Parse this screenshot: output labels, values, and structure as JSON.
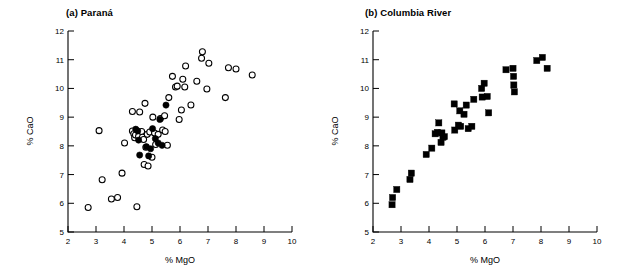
{
  "figure": {
    "background": "#ffffff",
    "ink": "#000000"
  },
  "panels": [
    {
      "id": "a",
      "title": "(a) Paraná",
      "xlabel": "% MgO",
      "ylabel": "% CaO"
    },
    {
      "id": "b",
      "title": "(b) Columbia River",
      "xlabel": "% MgO",
      "ylabel": "% CaO"
    }
  ],
  "axes": {
    "x_ticks": [
      "2",
      "3",
      "4",
      "5",
      "6",
      "7",
      "8",
      "9",
      "10"
    ],
    "y_ticks": [
      "5",
      "6",
      "7",
      "8",
      "9",
      "10",
      "11",
      "12"
    ],
    "xlim": [
      2,
      10
    ],
    "ylim": [
      5,
      12
    ]
  },
  "chart_data": [
    {
      "type": "scatter",
      "title": "(a) Paraná",
      "xlabel": "% MgO",
      "ylabel": "% CaO",
      "xlim": [
        2,
        10
      ],
      "ylim": [
        5,
        12
      ],
      "grid": false,
      "legend": "none",
      "series": [
        {
          "name": "open-circles",
          "marker": "open circle",
          "points": [
            [
              2.72,
              5.85
            ],
            [
              3.11,
              8.53
            ],
            [
              3.22,
              6.82
            ],
            [
              3.55,
              6.15
            ],
            [
              3.77,
              6.2
            ],
            [
              3.93,
              7.05
            ],
            [
              4.02,
              8.1
            ],
            [
              4.3,
              9.2
            ],
            [
              4.3,
              8.52
            ],
            [
              4.35,
              8.42
            ],
            [
              4.38,
              8.28
            ],
            [
              4.41,
              8.38
            ],
            [
              4.46,
              5.88
            ],
            [
              4.52,
              8.33
            ],
            [
              4.56,
              9.18
            ],
            [
              4.63,
              8.5
            ],
            [
              4.66,
              8.3
            ],
            [
              4.7,
              8.22
            ],
            [
              4.72,
              7.35
            ],
            [
              4.75,
              9.48
            ],
            [
              4.78,
              7.95
            ],
            [
              4.83,
              8.4
            ],
            [
              4.86,
              7.3
            ],
            [
              4.92,
              8.48
            ],
            [
              5.0,
              7.6
            ],
            [
              5.03,
              9.0
            ],
            [
              5.09,
              8.45
            ],
            [
              5.13,
              8.05
            ],
            [
              5.22,
              8.4
            ],
            [
              5.3,
              8.95
            ],
            [
              5.38,
              8.55
            ],
            [
              5.45,
              9.05
            ],
            [
              5.47,
              8.5
            ],
            [
              5.55,
              8.02
            ],
            [
              5.6,
              9.68
            ],
            [
              5.73,
              10.42
            ],
            [
              5.84,
              10.05
            ],
            [
              5.9,
              10.08
            ],
            [
              5.97,
              8.92
            ],
            [
              6.05,
              9.25
            ],
            [
              6.1,
              10.32
            ],
            [
              6.17,
              10.05
            ],
            [
              6.2,
              10.78
            ],
            [
              6.39,
              9.42
            ],
            [
              6.6,
              10.25
            ],
            [
              6.77,
              11.05
            ],
            [
              6.8,
              11.28
            ],
            [
              6.96,
              9.98
            ],
            [
              7.03,
              10.88
            ],
            [
              7.62,
              9.68
            ],
            [
              7.73,
              10.72
            ],
            [
              8.0,
              10.68
            ],
            [
              8.58,
              10.47
            ]
          ]
        },
        {
          "name": "filled-circles",
          "marker": "filled circle",
          "points": [
            [
              4.42,
              8.58
            ],
            [
              4.49,
              8.52
            ],
            [
              4.52,
              8.2
            ],
            [
              4.56,
              7.68
            ],
            [
              4.8,
              7.97
            ],
            [
              4.88,
              7.65
            ],
            [
              4.95,
              7.9
            ],
            [
              5.02,
              8.6
            ],
            [
              5.12,
              8.25
            ],
            [
              5.22,
              8.1
            ],
            [
              5.28,
              8.92
            ],
            [
              5.36,
              8.02
            ],
            [
              5.5,
              9.42
            ]
          ]
        }
      ]
    },
    {
      "type": "scatter",
      "title": "(b) Columbia River",
      "xlabel": "% MgO",
      "ylabel": "% CaO",
      "xlim": [
        2,
        10
      ],
      "ylim": [
        5,
        12
      ],
      "grid": false,
      "legend": "none",
      "series": [
        {
          "name": "filled-squares",
          "marker": "filled square",
          "points": [
            [
              2.68,
              5.95
            ],
            [
              2.7,
              6.2
            ],
            [
              2.85,
              6.48
            ],
            [
              3.32,
              6.83
            ],
            [
              3.37,
              7.05
            ],
            [
              3.9,
              7.7
            ],
            [
              4.1,
              7.92
            ],
            [
              4.22,
              8.42
            ],
            [
              4.3,
              8.47
            ],
            [
              4.35,
              8.8
            ],
            [
              4.43,
              8.12
            ],
            [
              4.46,
              8.45
            ],
            [
              4.5,
              8.3
            ],
            [
              4.55,
              8.32
            ],
            [
              4.9,
              9.46
            ],
            [
              4.92,
              8.55
            ],
            [
              5.05,
              8.72
            ],
            [
              5.1,
              9.22
            ],
            [
              5.13,
              8.68
            ],
            [
              5.25,
              9.1
            ],
            [
              5.33,
              9.42
            ],
            [
              5.4,
              8.6
            ],
            [
              5.53,
              8.68
            ],
            [
              5.6,
              9.62
            ],
            [
              5.88,
              10.0
            ],
            [
              5.9,
              9.7
            ],
            [
              5.97,
              10.18
            ],
            [
              6.08,
              9.72
            ],
            [
              6.13,
              9.15
            ],
            [
              6.75,
              10.65
            ],
            [
              7.0,
              10.7
            ],
            [
              7.02,
              10.42
            ],
            [
              7.03,
              10.12
            ],
            [
              7.05,
              9.88
            ],
            [
              7.85,
              10.97
            ],
            [
              8.05,
              11.08
            ],
            [
              8.22,
              10.7
            ]
          ]
        }
      ]
    }
  ]
}
